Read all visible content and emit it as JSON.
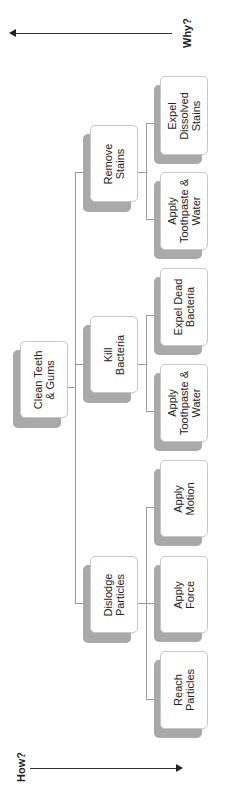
{
  "axes": {
    "why": {
      "label": "Why?",
      "direction": "left"
    },
    "how": {
      "label": "How?",
      "direction": "right"
    }
  },
  "tree": {
    "root": {
      "label": "Clean Teeth\n& Gums"
    },
    "branches": [
      {
        "label": "Remove\nStains",
        "children": [
          {
            "label": "Expel\nDissolved\nStains"
          },
          {
            "label": "Apply\nToothpaste &\nWater"
          }
        ]
      },
      {
        "label": "Kill\nBacteria",
        "children": [
          {
            "label": "Expel Dead\nBacteria"
          },
          {
            "label": "Apply\nToothpaste &\nWater"
          }
        ]
      },
      {
        "label": "Dislodge\nParticles",
        "children": [
          {
            "label": "Apply\nMotion"
          },
          {
            "label": "Apply\nForce"
          },
          {
            "label": "Reach\nParticles"
          }
        ]
      }
    ]
  },
  "colors": {
    "shadow": "#a9a9a9",
    "box_border": "#c8c8c8",
    "connector": "#9a9a9a",
    "axis": "#333333"
  }
}
